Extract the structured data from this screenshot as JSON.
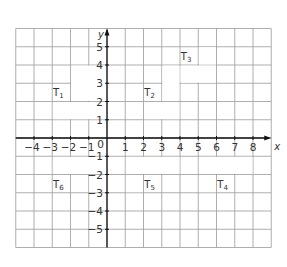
{
  "grid": {
    "x_min": -5,
    "x_max": 9,
    "y_min": -6,
    "y_max": 6,
    "unit_px": 18.25,
    "origin_px": [
      107,
      138
    ],
    "grid_color": "#9a9a9a",
    "axis_color": "#111111"
  },
  "axes": {
    "x_label": "x",
    "y_label": "y",
    "origin_label": "0",
    "x_ticks": [
      "-4",
      "-3",
      "-2",
      "-1",
      "1",
      "2",
      "3",
      "4",
      "5",
      "6",
      "7",
      "8"
    ],
    "x_tick_values": [
      -4,
      -3,
      -2,
      -1,
      1,
      2,
      3,
      4,
      5,
      6,
      7,
      8
    ],
    "y_ticks": [
      "5",
      "4",
      "3",
      "2",
      "1",
      "-1",
      "-2",
      "-3",
      "-4",
      "-5"
    ],
    "y_tick_values": [
      5,
      4,
      3,
      2,
      1,
      -1,
      -2,
      -3,
      -4,
      -5
    ]
  },
  "shapes": [
    {
      "name": "T",
      "sub": "1",
      "label_at": [
        -2.5,
        2.5
      ],
      "cells": [
        [
          -2,
          0,
          2,
          4
        ],
        [
          -3,
          0,
          1,
          2
        ]
      ]
    },
    {
      "name": "T",
      "sub": "2",
      "label_at": [
        2.5,
        2.5
      ],
      "cells": [
        [
          3,
          4,
          2,
          4
        ],
        [
          2,
          4,
          1,
          2
        ]
      ]
    },
    {
      "name": "T",
      "sub": "3",
      "label_at": [
        4.5,
        4.5
      ],
      "cells": [
        [
          5,
          6,
          4,
          5
        ],
        [
          4,
          6,
          3,
          4
        ]
      ]
    },
    {
      "name": "T",
      "sub": "4",
      "label_at": [
        6.5,
        -2.5
      ],
      "cells": [
        [
          5,
          8,
          -2,
          -1
        ],
        [
          5,
          6,
          -3,
          -2
        ]
      ]
    },
    {
      "name": "T",
      "sub": "5",
      "label_at": [
        2.5,
        -2.5
      ],
      "cells": [
        [
          1,
          4,
          -2,
          -1
        ],
        [
          1,
          2,
          -3,
          -2
        ]
      ]
    },
    {
      "name": "T",
      "sub": "6",
      "label_at": [
        -2.5,
        -2.5
      ],
      "cells": [
        [
          -3,
          0,
          -2,
          -1
        ],
        [
          -1,
          0,
          -3,
          -2
        ]
      ]
    }
  ]
}
